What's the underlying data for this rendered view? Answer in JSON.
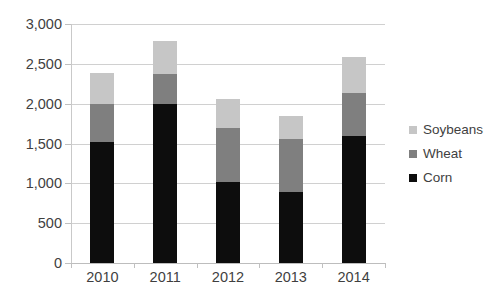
{
  "chart_data": {
    "type": "bar",
    "stacked": true,
    "title": "",
    "subtitle": "",
    "xlabel": "",
    "ylabel": "",
    "categories": [
      "2010",
      "2011",
      "2012",
      "2013",
      "2014"
    ],
    "series": [
      {
        "name": "Corn",
        "color": "#0d0d0d",
        "values": [
          1520,
          2000,
          1020,
          890,
          1600
        ]
      },
      {
        "name": "Wheat",
        "color": "#7f7f7f",
        "values": [
          480,
          370,
          680,
          665,
          540
        ]
      },
      {
        "name": "Soybeans",
        "color": "#c6c6c6",
        "values": [
          390,
          420,
          360,
          295,
          450
        ]
      }
    ],
    "cumulative_tops": {
      "corn": [
        1520,
        2000,
        1020,
        890,
        1600
      ],
      "wheat": [
        2000,
        2370,
        1700,
        1555,
        2140
      ],
      "soybeans": [
        2390,
        2790,
        2060,
        1850,
        2590
      ]
    },
    "totals": [
      2390,
      2790,
      2060,
      1850,
      2590
    ],
    "ylim": [
      0,
      3000
    ],
    "ytick_values": [
      0,
      500,
      1000,
      1500,
      2000,
      2500,
      3000
    ],
    "ytick_labels": [
      "0",
      "500",
      "1,000",
      "1,500",
      "2,000",
      "2,500",
      "3,000"
    ],
    "grid": true,
    "legend_position": "right",
    "legend": [
      {
        "label": "Soybeans",
        "color": "#c6c6c6"
      },
      {
        "label": "Wheat",
        "color": "#7f7f7f"
      },
      {
        "label": "Corn",
        "color": "#0d0d0d"
      }
    ]
  }
}
